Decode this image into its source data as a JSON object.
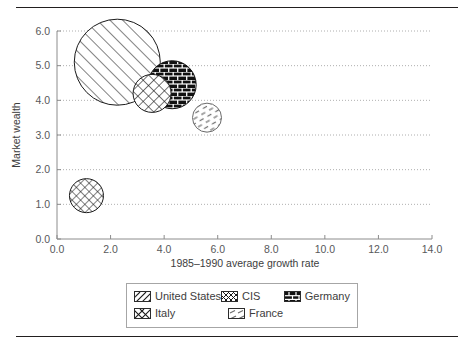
{
  "figure": {
    "top_rule": true,
    "bottom_rule": true
  },
  "chart_data": {
    "type": "scatter",
    "title": "",
    "subtitle": "",
    "xlabel": "1985–1990 average growth rate",
    "ylabel": "Market wealth",
    "xlim": [
      0.0,
      14.0
    ],
    "ylim": [
      0.0,
      6.0
    ],
    "xticks": [
      "0.0",
      "2.0",
      "4.0",
      "6.0",
      "8.0",
      "10.0",
      "12.0",
      "14.0"
    ],
    "yticks": [
      "0.0",
      "1.0",
      "2.0",
      "3.0",
      "4.0",
      "5.0",
      "6.0"
    ],
    "xtick_values": [
      0,
      2,
      4,
      6,
      8,
      10,
      12,
      14
    ],
    "ytick_values": [
      0,
      1,
      2,
      3,
      4,
      5,
      6
    ],
    "grid": "horizontal-dotted",
    "legend_position": "below-axes",
    "bubble_size_encodes": "market size",
    "series": [
      {
        "name": "United States",
        "x": 2.25,
        "y": 5.1,
        "radius_px": 43,
        "pattern": "diagonal-stripes",
        "fill": "#ffffff",
        "stroke": "#1a1a1a"
      },
      {
        "name": "Italy",
        "x": 3.55,
        "y": 4.2,
        "radius_px": 19,
        "pattern": "diamond-crosshatch",
        "fill": "#ffffff",
        "stroke": "#1a1a1a"
      },
      {
        "name": "Germany",
        "x": 4.3,
        "y": 4.45,
        "radius_px": 24,
        "pattern": "brick-solid",
        "fill": "#111111",
        "stroke": "#111111"
      },
      {
        "name": "France",
        "x": 5.6,
        "y": 3.5,
        "radius_px": 14.5,
        "pattern": "sparse-dashes",
        "fill": "#ffffff",
        "stroke": "#6b6b6b"
      },
      {
        "name": "CIS",
        "x": 1.1,
        "y": 1.25,
        "radius_px": 17,
        "pattern": "dense-crosshatch",
        "fill": "#ffffff",
        "stroke": "#1a1a1a"
      }
    ]
  },
  "legend": {
    "rows": [
      [
        {
          "label": "United States",
          "pattern": "diagonal-stripes"
        },
        {
          "label": "CIS",
          "pattern": "dense-crosshatch"
        },
        {
          "label": "Germany",
          "pattern": "brick-solid"
        }
      ],
      [
        {
          "label": "Italy",
          "pattern": "diamond-crosshatch"
        },
        {
          "label": "France",
          "pattern": "sparse-dashes"
        }
      ]
    ]
  }
}
